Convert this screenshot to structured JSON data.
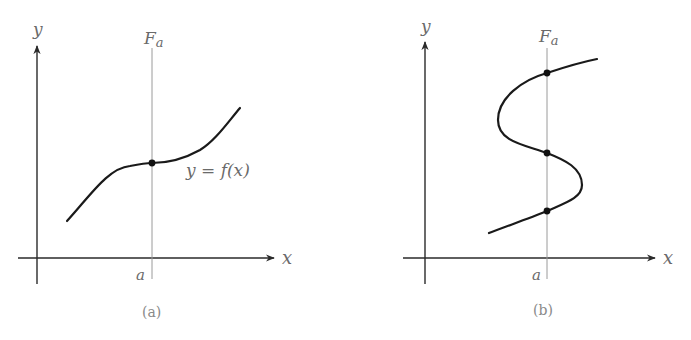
{
  "figure": {
    "colors": {
      "curve": "#1a1a1a",
      "axes": "#2a2a2a",
      "vertical_line": "#9a9a9a",
      "labels": "#6a6a6a"
    },
    "panels": [
      {
        "id": "a",
        "caption": "(a)",
        "axis_x_label": "x",
        "axis_y_label": "y",
        "vertical_line_label_main": "F",
        "vertical_line_label_sub": "a",
        "tick_label": "a",
        "curve_label": "y = f(x)",
        "intersection_count": 1
      },
      {
        "id": "b",
        "caption": "(b)",
        "axis_x_label": "x",
        "axis_y_label": "y",
        "vertical_line_label_main": "F",
        "vertical_line_label_sub": "a",
        "tick_label": "a",
        "intersection_count": 3
      }
    ]
  }
}
